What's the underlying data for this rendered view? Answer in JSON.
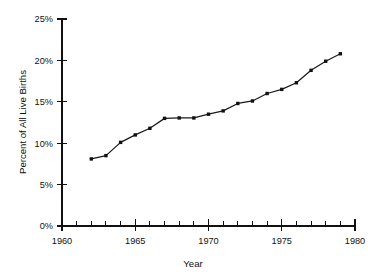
{
  "chart_data": {
    "type": "line",
    "title": "",
    "xlabel": "Year",
    "ylabel": "Percent of All Live Births",
    "xlim": [
      1960,
      1980
    ],
    "ylim": [
      0,
      25
    ],
    "grid": false,
    "legend": null,
    "x_tick_labels": [
      "1960",
      "1965",
      "1970",
      "1975",
      "1980"
    ],
    "x_tick_values": [
      1960,
      1965,
      1970,
      1975,
      1980
    ],
    "x_minor_tick_values": [
      1961,
      1962,
      1963,
      1964,
      1966,
      1967,
      1968,
      1969,
      1971,
      1972,
      1973,
      1974,
      1976,
      1977,
      1978,
      1979
    ],
    "y_tick_labels": [
      "0%",
      "5%",
      "10%",
      "15%",
      "20%",
      "25%"
    ],
    "y_tick_values": [
      0,
      5,
      10,
      15,
      20,
      25
    ],
    "series_color": "#111111",
    "marker": "square",
    "x": [
      1962,
      1963,
      1964,
      1965,
      1966,
      1967,
      1968,
      1969,
      1970,
      1971,
      1972,
      1973,
      1974,
      1975,
      1976,
      1977,
      1978,
      1979
    ],
    "values": [
      8.1,
      8.5,
      10.1,
      11.0,
      11.8,
      13.0,
      13.05,
      13.05,
      13.5,
      13.9,
      14.8,
      15.1,
      16.0,
      16.5,
      17.3,
      18.8,
      19.9,
      20.8
    ],
    "points": [
      {
        "year": 1962,
        "percent": 8.1
      },
      {
        "year": 1963,
        "percent": 8.5
      },
      {
        "year": 1964,
        "percent": 10.1
      },
      {
        "year": 1965,
        "percent": 11.0
      },
      {
        "year": 1966,
        "percent": 11.8
      },
      {
        "year": 1967,
        "percent": 13.0
      },
      {
        "year": 1968,
        "percent": 13.05
      },
      {
        "year": 1969,
        "percent": 13.05
      },
      {
        "year": 1970,
        "percent": 13.5
      },
      {
        "year": 1971,
        "percent": 13.9
      },
      {
        "year": 1972,
        "percent": 14.8
      },
      {
        "year": 1973,
        "percent": 15.1
      },
      {
        "year": 1974,
        "percent": 16.0
      },
      {
        "year": 1975,
        "percent": 16.5
      },
      {
        "year": 1976,
        "percent": 17.3
      },
      {
        "year": 1977,
        "percent": 18.8
      },
      {
        "year": 1978,
        "percent": 19.9
      },
      {
        "year": 1979,
        "percent": 20.8
      }
    ]
  }
}
